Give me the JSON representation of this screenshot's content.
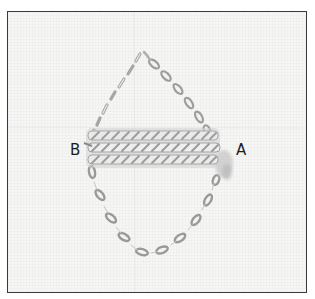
{
  "figure": {
    "labels": {
      "left": "B",
      "right": "A"
    },
    "colors": {
      "frame_border": "#3a3a3a",
      "fabric": "#f6f6f5",
      "thread_shadow": "#9a9a9a",
      "thread_highlight": "#ffffff",
      "label_text": "#1e1e1e"
    },
    "cord_count": 3
  }
}
